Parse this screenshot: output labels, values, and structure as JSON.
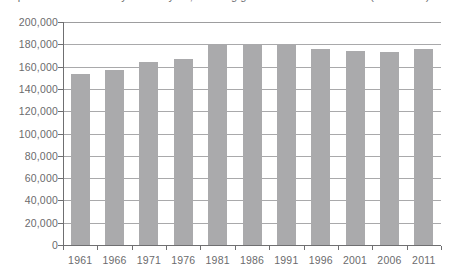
{
  "caption": {
    "clipped_text": "Population of Canada by census year, showing growth from 1961 to 2011 (thousands)"
  },
  "chart_data": {
    "type": "bar",
    "title": "",
    "xlabel": "",
    "ylabel": "",
    "categories": [
      "1961",
      "1966",
      "1971",
      "1976",
      "1981",
      "1986",
      "1991",
      "1996",
      "2001",
      "2006",
      "2011"
    ],
    "values": [
      153000,
      157000,
      164000,
      167000,
      179000,
      180000,
      180000,
      176000,
      174000,
      173000,
      176000
    ],
    "ylim": [
      0,
      200000
    ],
    "ytick_values": [
      0,
      20000,
      40000,
      60000,
      80000,
      100000,
      120000,
      140000,
      160000,
      180000,
      200000
    ],
    "ytick_labels": [
      "0",
      "20,000",
      "40,000",
      "60,000",
      "80,000",
      "100,000",
      "120,000",
      "140,000",
      "160,000",
      "180,000",
      "200,000"
    ],
    "grid": true,
    "legend": null,
    "bar_color": "#aaaaac",
    "gridline_color": "#a9a9ab",
    "axis_color": "#6f6f71",
    "text_color": "#6b6b6d"
  }
}
